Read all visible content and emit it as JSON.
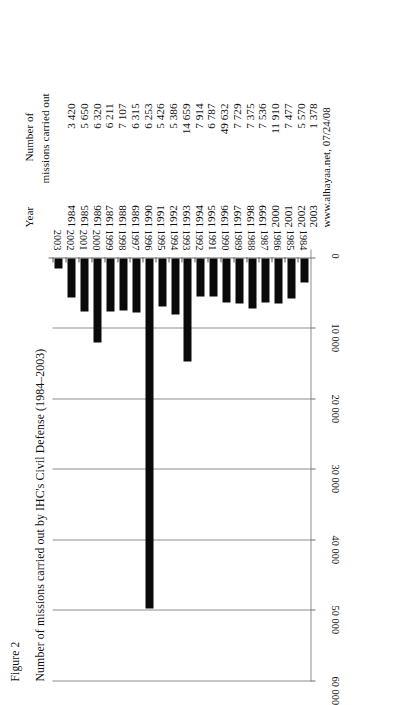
{
  "figure": {
    "label": "Figure 2",
    "title": "Number of missions carried out by IHC's Civil Defense (1984–2003)"
  },
  "table": {
    "headers": {
      "year": "Year",
      "value_line1": "Number of",
      "value_line2": "missions carried out"
    },
    "rows": [
      {
        "year": "1984",
        "value": "3 420"
      },
      {
        "year": "1985",
        "value": "5 650"
      },
      {
        "year": "1986",
        "value": "6 320"
      },
      {
        "year": "1987",
        "value": "6 211"
      },
      {
        "year": "1988",
        "value": "7 107"
      },
      {
        "year": "1989",
        "value": "6 315"
      },
      {
        "year": "1990",
        "value": "6 253"
      },
      {
        "year": "1991",
        "value": "5 426"
      },
      {
        "year": "1992",
        "value": "5 386"
      },
      {
        "year": "1993",
        "value": "14 659"
      },
      {
        "year": "1994",
        "value": "7 914"
      },
      {
        "year": "1995",
        "value": "6 787"
      },
      {
        "year": "1996",
        "value": "49 632"
      },
      {
        "year": "1997",
        "value": "7 729"
      },
      {
        "year": "1998",
        "value": "7 375"
      },
      {
        "year": "1999",
        "value": "7 536"
      },
      {
        "year": "2000",
        "value": "11 910"
      },
      {
        "year": "2001",
        "value": "7 477"
      },
      {
        "year": "2002",
        "value": "5 570"
      },
      {
        "year": "2003",
        "value": "1 378"
      }
    ]
  },
  "source": "www.alhayaa.net, 07/24/08",
  "chart_data": {
    "type": "bar",
    "orientation": "horizontal",
    "title": "Number of missions carried out by IHC's Civil Defense (1984–2003)",
    "xlabel": "",
    "ylabel": "",
    "categories": [
      "1984",
      "1985",
      "1986",
      "1987",
      "1988",
      "1989",
      "1990",
      "1991",
      "1992",
      "1993",
      "1994",
      "1995",
      "1996",
      "1997",
      "1998",
      "1999",
      "2000",
      "2001",
      "2002",
      "2003"
    ],
    "values": [
      3420,
      5650,
      6320,
      6211,
      7107,
      6315,
      6253,
      5426,
      5386,
      14659,
      7914,
      6787,
      49632,
      7729,
      7375,
      7536,
      11910,
      7477,
      5570,
      1378
    ],
    "value_axis_ticks": [
      "0",
      "10 000",
      "20 000",
      "30 000",
      "40 000",
      "50 000",
      "60 000"
    ],
    "value_axis_tick_values": [
      0,
      10000,
      20000,
      30000,
      40000,
      50000,
      60000
    ],
    "xlim": [
      0,
      60000
    ],
    "grid": true,
    "legend": false,
    "bar_color": "#0a0a0a"
  }
}
